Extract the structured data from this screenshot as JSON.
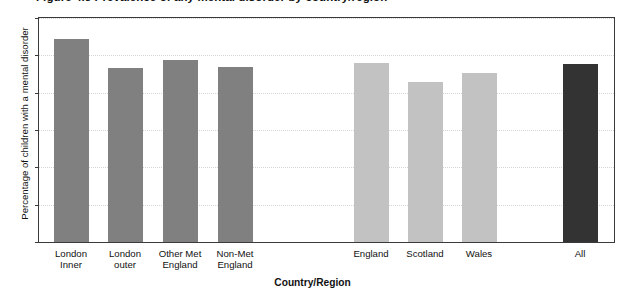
{
  "caption": {
    "text": "Figure 4.5  Prevalence of any mental disorder by country/region"
  },
  "chart_data": {
    "type": "bar",
    "title": "Figure 4.5  Prevalence of any mental disorder by country/region",
    "xlabel": "Country/Region",
    "ylabel": "Percentage of children with a mental disorder",
    "ylim": [
      0,
      12
    ],
    "ytick_labels": [
      "0",
      "2",
      "4",
      "6",
      "8",
      "10",
      "12"
    ],
    "yticks": [
      0,
      2,
      4,
      6,
      8,
      10,
      12
    ],
    "grid": true,
    "legend": "none",
    "categories": [
      "London\nInner",
      "London\nouter",
      "Other Met\nEngland",
      "Non-Met\nEngland",
      "England",
      "Scotland",
      "Wales",
      "All"
    ],
    "values": [
      10.9,
      9.3,
      9.75,
      9.4,
      9.6,
      8.55,
      9.05,
      9.55
    ],
    "bar_colors": [
      "#808080",
      "#808080",
      "#808080",
      "#808080",
      "#c2c2c2",
      "#c2c2c2",
      "#c2c2c2",
      "#333333"
    ],
    "groups": [
      {
        "name": "Regions of England",
        "color": "#808080",
        "indices": [
          0,
          1,
          2,
          3
        ]
      },
      {
        "name": "Countries",
        "color": "#c2c2c2",
        "indices": [
          4,
          5,
          6
        ]
      },
      {
        "name": "All",
        "color": "#333333",
        "indices": [
          7
        ]
      }
    ]
  },
  "colors": {
    "axis": "#3a3a3a",
    "gridline": "#d8d2d2",
    "text": "#111111",
    "background": "#ffffff"
  }
}
